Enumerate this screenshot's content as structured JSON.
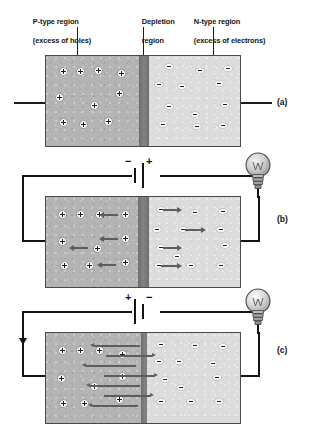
{
  "figure": {
    "labels": {
      "p_region_line1": "P-type region",
      "p_region_line2": "(excess of holes)",
      "depletion_line1": "Depletion",
      "depletion_line2": "region",
      "n_region_line1": "N-type region",
      "n_region_line2": "(excess of electrons)"
    },
    "panel_labels": {
      "a": "(a)",
      "b": "(b)",
      "c": "(c)"
    },
    "battery": {
      "b_left_sign": "−",
      "b_right_sign": "+",
      "c_left_sign": "+",
      "c_right_sign": "−"
    },
    "colors": {
      "p_type_fill": "#b4b4b4",
      "n_type_fill": "#dcdcdc",
      "depletion_fill": "#7b7b7b",
      "wire": "#141414",
      "arrow": "#5d5d5d",
      "carrier_fill": "#fdfdfd",
      "background": "#ffffff"
    },
    "panels": [
      {
        "id": "a",
        "name": "unbiased-junction",
        "state": "no external bias",
        "depletion_width_px": 10,
        "has_battery": false,
        "has_bulb": false,
        "bulb_lit": false,
        "holes": [
          {
            "x": 14,
            "y": 12
          },
          {
            "x": 31,
            "y": 12
          },
          {
            "x": 49,
            "y": 11
          },
          {
            "x": 72,
            "y": 14
          },
          {
            "x": 10,
            "y": 38
          },
          {
            "x": 70,
            "y": 34
          },
          {
            "x": 45,
            "y": 46
          },
          {
            "x": 14,
            "y": 63
          },
          {
            "x": 34,
            "y": 65
          },
          {
            "x": 59,
            "y": 62
          }
        ],
        "electrons": [
          {
            "x": 16,
            "y": 8
          },
          {
            "x": 47,
            "y": 12
          },
          {
            "x": 75,
            "y": 10
          },
          {
            "x": 6,
            "y": 26
          },
          {
            "x": 29,
            "y": 28
          },
          {
            "x": 66,
            "y": 25
          },
          {
            "x": 16,
            "y": 48
          },
          {
            "x": 72,
            "y": 46
          },
          {
            "x": 42,
            "y": 56
          },
          {
            "x": 10,
            "y": 66
          },
          {
            "x": 44,
            "y": 68
          },
          {
            "x": 70,
            "y": 67
          }
        ],
        "arrows": []
      },
      {
        "id": "b",
        "name": "reverse-biased-junction",
        "state": "reverse bias - carriers pulled away from junction, depletion widens, bulb off",
        "depletion_width_px": 11,
        "has_battery": true,
        "has_bulb": true,
        "bulb_lit": false,
        "holes": [
          {
            "x": 13,
            "y": 14
          },
          {
            "x": 31,
            "y": 14
          },
          {
            "x": 50,
            "y": 14
          },
          {
            "x": 76,
            "y": 14
          },
          {
            "x": 13,
            "y": 41
          },
          {
            "x": 76,
            "y": 38
          },
          {
            "x": 48,
            "y": 48
          },
          {
            "x": 15,
            "y": 65
          },
          {
            "x": 40,
            "y": 65
          },
          {
            "x": 76,
            "y": 62
          }
        ],
        "electrons": [
          {
            "x": 8,
            "y": 10
          },
          {
            "x": 42,
            "y": 13
          },
          {
            "x": 70,
            "y": 12
          },
          {
            "x": 4,
            "y": 30
          },
          {
            "x": 30,
            "y": 30
          },
          {
            "x": 68,
            "y": 30
          },
          {
            "x": 8,
            "y": 48
          },
          {
            "x": 72,
            "y": 46
          },
          {
            "x": 24,
            "y": 57
          },
          {
            "x": 6,
            "y": 66
          },
          {
            "x": 38,
            "y": 66
          },
          {
            "x": 68,
            "y": 66
          }
        ],
        "arrows": [
          {
            "side": "p",
            "dir": "left",
            "x": 58,
            "y": 17,
            "len": 14
          },
          {
            "side": "p",
            "dir": "left",
            "x": 58,
            "y": 41,
            "len": 14
          },
          {
            "side": "p",
            "dir": "left",
            "x": 28,
            "y": 50,
            "len": 14
          },
          {
            "side": "p",
            "dir": "left",
            "x": 56,
            "y": 67,
            "len": 14
          },
          {
            "side": "n",
            "dir": "right",
            "x": 14,
            "y": 12,
            "len": 14
          },
          {
            "side": "n",
            "dir": "right",
            "x": 36,
            "y": 32,
            "len": 16
          },
          {
            "side": "n",
            "dir": "right",
            "x": 14,
            "y": 50,
            "len": 14
          },
          {
            "side": "n",
            "dir": "right",
            "x": 12,
            "y": 68,
            "len": 16
          }
        ]
      },
      {
        "id": "c",
        "name": "forward-biased-junction",
        "state": "forward bias - carriers cross junction, depletion narrows, current flows, bulb on",
        "depletion_width_px": 8,
        "has_battery": true,
        "has_bulb": true,
        "bulb_lit": true,
        "has_current_arrow": true,
        "holes": [
          {
            "x": 13,
            "y": 14
          },
          {
            "x": 31,
            "y": 14
          },
          {
            "x": 50,
            "y": 14
          },
          {
            "x": 73,
            "y": 18
          },
          {
            "x": 12,
            "y": 42
          },
          {
            "x": 73,
            "y": 40
          },
          {
            "x": 45,
            "y": 50
          },
          {
            "x": 14,
            "y": 67
          },
          {
            "x": 35,
            "y": 67
          },
          {
            "x": 70,
            "y": 63
          }
        ],
        "electrons": [
          {
            "x": 10,
            "y": 9
          },
          {
            "x": 44,
            "y": 10
          },
          {
            "x": 72,
            "y": 11
          },
          {
            "x": 8,
            "y": 26
          },
          {
            "x": 28,
            "y": 26
          },
          {
            "x": 62,
            "y": 28
          },
          {
            "x": 14,
            "y": 44
          },
          {
            "x": 66,
            "y": 42
          },
          {
            "x": 30,
            "y": 52
          },
          {
            "x": 10,
            "y": 66
          },
          {
            "x": 40,
            "y": 66
          },
          {
            "x": 68,
            "y": 66
          }
        ],
        "arrows": [
          {
            "side": "cross",
            "dir": "left",
            "x": 48,
            "y": 12,
            "len": 46
          },
          {
            "side": "cross",
            "dir": "right",
            "x": 60,
            "y": 22,
            "len": 46
          },
          {
            "side": "cross",
            "dir": "left",
            "x": 40,
            "y": 32,
            "len": 50
          },
          {
            "side": "cross",
            "dir": "right",
            "x": 58,
            "y": 42,
            "len": 50
          },
          {
            "side": "cross",
            "dir": "left",
            "x": 44,
            "y": 52,
            "len": 50
          },
          {
            "side": "cross",
            "dir": "right",
            "x": 58,
            "y": 62,
            "len": 46
          },
          {
            "side": "cross",
            "dir": "left",
            "x": 46,
            "y": 72,
            "len": 46
          }
        ]
      }
    ]
  }
}
